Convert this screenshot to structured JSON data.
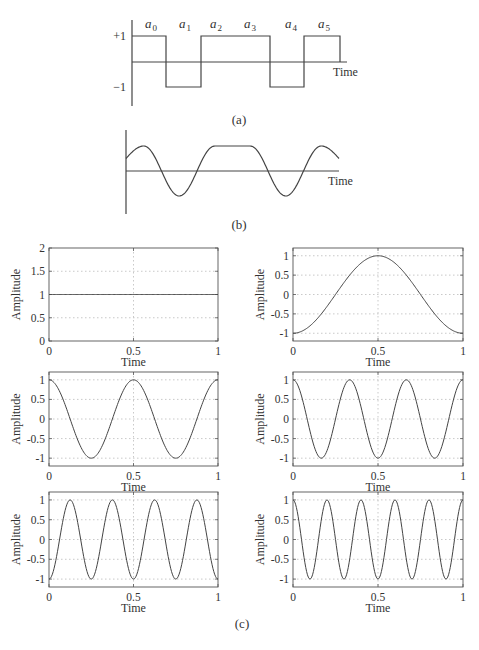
{
  "figure_a": {
    "caption": "(a)",
    "y_labels": {
      "plus": "+1",
      "minus": "−1"
    },
    "x_label": "Time",
    "symbols": [
      {
        "base": "a",
        "sub": "0"
      },
      {
        "base": "a",
        "sub": "1"
      },
      {
        "base": "a",
        "sub": "2"
      },
      {
        "base": "a",
        "sub": "3"
      },
      {
        "base": "a",
        "sub": "4"
      },
      {
        "base": "a",
        "sub": "5"
      }
    ],
    "bits": [
      1,
      -1,
      1,
      1,
      -1,
      1
    ]
  },
  "figure_b": {
    "caption": "(b)",
    "x_label": "Time"
  },
  "figure_c": {
    "caption": "(c)"
  },
  "chart_data": [
    {
      "type": "line",
      "title": "(a) Binary data sequence",
      "xlabel": "Time",
      "ylabel": "",
      "categories": [
        "a0",
        "a1",
        "a2",
        "a3",
        "a4",
        "a5"
      ],
      "values": [
        1,
        -1,
        1,
        1,
        -1,
        1
      ],
      "ylim": [
        -1,
        1
      ]
    },
    {
      "type": "line",
      "title": "(b) Band-limited waveform of data sequence",
      "xlabel": "Time",
      "ylabel": "",
      "description": "Smoothed version of (a): peaks where bits are +1, troughs where -1, flat top over a2-a3"
    },
    {
      "type": "line",
      "title": "(c) component 1: constant",
      "xlabel": "Time",
      "ylabel": "Amplitude",
      "x": [
        0,
        0.5,
        1
      ],
      "values": [
        1,
        1,
        1
      ],
      "xlim": [
        0,
        1
      ],
      "ylim": [
        0,
        2
      ],
      "xticks": [
        "0",
        "0.5",
        "1"
      ],
      "yticks": [
        "0",
        "0.5",
        "1",
        "1.5",
        "2"
      ],
      "grid": true
    },
    {
      "type": "line",
      "title": "(c) component 2: -cos(2πt)",
      "xlabel": "Time",
      "ylabel": "Amplitude",
      "x": [
        0,
        0.25,
        0.5,
        0.75,
        1
      ],
      "values": [
        -1,
        0,
        1,
        0,
        -1
      ],
      "xlim": [
        0,
        1
      ],
      "ylim": [
        -1.2,
        1.2
      ],
      "xticks": [
        "0",
        "0.5",
        "1"
      ],
      "yticks": [
        "-1",
        "-0.5",
        "0",
        "0.5",
        "1"
      ],
      "grid": true
    },
    {
      "type": "line",
      "title": "(c) component 3: cos(4πt)",
      "xlabel": "Time",
      "ylabel": "Amplitude",
      "x": [
        0,
        0.25,
        0.5,
        0.75,
        1
      ],
      "values": [
        1,
        -1,
        1,
        -1,
        1
      ],
      "xlim": [
        0,
        1
      ],
      "ylim": [
        -1.2,
        1.2
      ],
      "xticks": [
        "0",
        "0.5",
        "1"
      ],
      "yticks": [
        "-1",
        "-0.5",
        "0",
        "0.5",
        "1"
      ],
      "grid": true
    },
    {
      "type": "line",
      "title": "(c) component 4: cos(6πt)",
      "xlabel": "Time",
      "ylabel": "Amplitude",
      "x": [
        0,
        0.1667,
        0.3333,
        0.5,
        0.6667,
        0.8333,
        1
      ],
      "values": [
        1,
        -1,
        1,
        -1,
        1,
        -1,
        1
      ],
      "xlim": [
        0,
        1
      ],
      "ylim": [
        -1.2,
        1.2
      ],
      "xticks": [
        "0",
        "0.5",
        "1"
      ],
      "yticks": [
        "-1",
        "-0.5",
        "0",
        "0.5",
        "1"
      ],
      "grid": true
    },
    {
      "type": "line",
      "title": "(c) component 5: -cos(8πt)",
      "xlabel": "Time",
      "ylabel": "Amplitude",
      "x": [
        0,
        0.125,
        0.25,
        0.375,
        0.5,
        0.625,
        0.75,
        0.875,
        1
      ],
      "values": [
        -1,
        1,
        -1,
        1,
        -1,
        1,
        -1,
        1,
        -1
      ],
      "xlim": [
        0,
        1
      ],
      "ylim": [
        -1.2,
        1.2
      ],
      "xticks": [
        "0",
        "0.5",
        "1"
      ],
      "yticks": [
        "-1",
        "-0.5",
        "0",
        "0.5",
        "1"
      ],
      "grid": true
    },
    {
      "type": "line",
      "title": "(c) component 6: cos(10πt)",
      "xlabel": "Time",
      "ylabel": "Amplitude",
      "x": [
        0,
        0.1,
        0.2,
        0.3,
        0.4,
        0.5,
        0.6,
        0.7,
        0.8,
        0.9,
        1
      ],
      "values": [
        1,
        -1,
        1,
        -1,
        1,
        -1,
        1,
        -1,
        1,
        -1,
        1
      ],
      "xlim": [
        0,
        1
      ],
      "ylim": [
        -1.2,
        1.2
      ],
      "xticks": [
        "0",
        "0.5",
        "1"
      ],
      "yticks": [
        "-1",
        "-0.5",
        "0",
        "0.5",
        "1"
      ],
      "grid": true
    }
  ],
  "subplots": [
    {
      "ylabel": "Amplitude",
      "xlabel": "Time",
      "xticks": [
        "0",
        "0.5",
        "1"
      ],
      "yticks": [
        "0",
        "0.5",
        "1",
        "1.5",
        "2"
      ],
      "ymin": 0,
      "ymax": 2,
      "kind": "const",
      "freq": 0,
      "phase": 1
    },
    {
      "ylabel": "Amplitude",
      "xlabel": "Time",
      "xticks": [
        "0",
        "0.5",
        "1"
      ],
      "yticks": [
        "-1",
        "-0.5",
        "0",
        "0.5",
        "1"
      ],
      "ymin": -1.2,
      "ymax": 1.2,
      "kind": "cos",
      "freq": 1,
      "phase": -1
    },
    {
      "ylabel": "Amplitude",
      "xlabel": "Time",
      "xticks": [
        "0",
        "0.5",
        "1"
      ],
      "yticks": [
        "-1",
        "-0.5",
        "0",
        "0.5",
        "1"
      ],
      "ymin": -1.2,
      "ymax": 1.2,
      "kind": "cos",
      "freq": 2,
      "phase": 1
    },
    {
      "ylabel": "Amplitude",
      "xlabel": "Time",
      "xticks": [
        "0",
        "0.5",
        "1"
      ],
      "yticks": [
        "-1",
        "-0.5",
        "0",
        "0.5",
        "1"
      ],
      "ymin": -1.2,
      "ymax": 1.2,
      "kind": "cos",
      "freq": 3,
      "phase": 1
    },
    {
      "ylabel": "Amplitude",
      "xlabel": "Time",
      "xticks": [
        "0",
        "0.5",
        "1"
      ],
      "yticks": [
        "-1",
        "-0.5",
        "0",
        "0.5",
        "1"
      ],
      "ymin": -1.2,
      "ymax": 1.2,
      "kind": "cos",
      "freq": 4,
      "phase": -1
    },
    {
      "ylabel": "Amplitude",
      "xlabel": "Time",
      "xticks": [
        "0",
        "0.5",
        "1"
      ],
      "yticks": [
        "-1",
        "-0.5",
        "0",
        "0.5",
        "1"
      ],
      "ymin": -1.2,
      "ymax": 1.2,
      "kind": "cos",
      "freq": 5,
      "phase": 1
    }
  ]
}
